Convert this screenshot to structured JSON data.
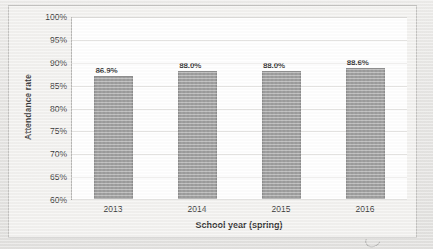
{
  "chart_data": {
    "type": "bar",
    "title": "",
    "xlabel": "School year (spring)",
    "ylabel": "Attendance rate",
    "categories": [
      "2013",
      "2014",
      "2015",
      "2016"
    ],
    "values": [
      86.9,
      88.0,
      88.0,
      88.6
    ],
    "value_labels": [
      "86.9%",
      "88.0%",
      "88.0%",
      "88.6%"
    ],
    "ylim": [
      60,
      100
    ],
    "ytick_step": 5,
    "ytick_labels": [
      "100%",
      "95%",
      "90%",
      "85%",
      "80%",
      "75%",
      "70%",
      "65%",
      "60%"
    ],
    "ytick_values": [
      100,
      95,
      90,
      85,
      80,
      75,
      70,
      65,
      60
    ],
    "grid": true,
    "grid_axis": "y",
    "legend": false,
    "legend_position": "none",
    "series": [
      {
        "name": "Attendance rate",
        "values": [
          86.9,
          88.0,
          88.0,
          88.6
        ],
        "color": "#9c9c9c"
      }
    ]
  },
  "colors": {
    "bar": "#9c9c9c",
    "bar_border": "#8f8f8f",
    "plot_background": "#ffffff",
    "gridline": "#e6e5e3",
    "axis": "#8d8c8a",
    "page_background": "#e9e9e7",
    "frame_background": "#f3f2f0",
    "text": "#333333"
  }
}
